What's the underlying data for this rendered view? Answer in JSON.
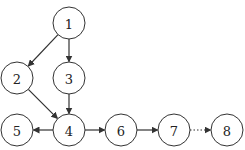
{
  "diagram": {
    "type": "directed-graph",
    "nodes": [
      {
        "id": "1",
        "label": "1",
        "x": 69,
        "y": 23
      },
      {
        "id": "2",
        "label": "2",
        "x": 17,
        "y": 78
      },
      {
        "id": "3",
        "label": "3",
        "x": 69,
        "y": 78
      },
      {
        "id": "4",
        "label": "4",
        "x": 69,
        "y": 130
      },
      {
        "id": "5",
        "label": "5",
        "x": 17,
        "y": 130
      },
      {
        "id": "6",
        "label": "6",
        "x": 121,
        "y": 130
      },
      {
        "id": "7",
        "label": "7",
        "x": 174,
        "y": 130
      },
      {
        "id": "8",
        "label": "8",
        "x": 227,
        "y": 130
      }
    ],
    "edges": [
      {
        "from": "1",
        "to": "2",
        "style": "solid"
      },
      {
        "from": "1",
        "to": "3",
        "style": "solid"
      },
      {
        "from": "2",
        "to": "4",
        "style": "solid"
      },
      {
        "from": "3",
        "to": "4",
        "style": "solid"
      },
      {
        "from": "4",
        "to": "5",
        "style": "solid"
      },
      {
        "from": "4",
        "to": "6",
        "style": "solid"
      },
      {
        "from": "6",
        "to": "7",
        "style": "solid"
      },
      {
        "from": "7",
        "to": "8",
        "style": "dotted"
      }
    ],
    "node_radius": 16
  }
}
